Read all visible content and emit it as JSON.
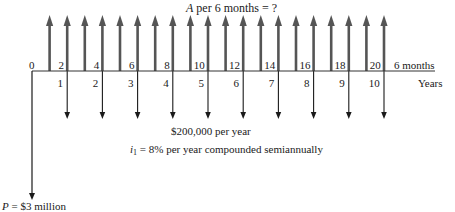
{
  "title": {
    "variable": "A",
    "text": " per 6 months = ?"
  },
  "axis": {
    "origin_label": "0",
    "half_year_labels": [
      "2",
      "4",
      "6",
      "8",
      "10",
      "12",
      "14",
      "16",
      "18",
      "20"
    ],
    "year_labels": [
      "1",
      "2",
      "3",
      "4",
      "5",
      "6",
      "7",
      "8",
      "9",
      "10"
    ],
    "upper_unit": "6 months",
    "lower_unit": "Years"
  },
  "cash_flows": {
    "receipts_label": "A per 6 months = ?",
    "expense_label": "$200,000 per year",
    "rate_var": "i",
    "rate_sub": "1",
    "rate_text": " = 8% per year compounded semiannually",
    "present_var": "P",
    "present_text": " = $3 million"
  },
  "colors": {
    "up_arrow": "#555555",
    "down_arrow": "#1a1a1a",
    "axis": "#333333"
  },
  "chart_data": {
    "type": "cash-flow-diagram",
    "periods_semiannual": 20,
    "periods_years": 10,
    "upward": {
      "label": "A per 6 months = ?",
      "at_half_periods": [
        1,
        2,
        3,
        4,
        5,
        6,
        7,
        8,
        9,
        10,
        11,
        12,
        13,
        14,
        15,
        16,
        17,
        18,
        19,
        20
      ]
    },
    "downward_annual": {
      "label": "$200,000 per year",
      "at_years": [
        1,
        2,
        3,
        4,
        5,
        6,
        7,
        8,
        9,
        10
      ]
    },
    "present_value": {
      "label": "P = $3 million",
      "at_period": 0,
      "direction": "down"
    },
    "interest": "i1 = 8% per year compounded semiannually"
  }
}
